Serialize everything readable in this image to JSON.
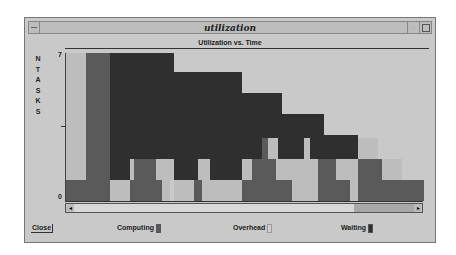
{
  "window": {
    "title": "utilization"
  },
  "chart": {
    "title": "Utilization vs. Time",
    "ylabel": [
      "N",
      "T",
      "A",
      "S",
      "K",
      "S"
    ],
    "ytick_top": "7",
    "ytick_bottom": "0"
  },
  "colors": {
    "computing": "#5a5a5a",
    "overhead": "#bdbdbd",
    "waiting": "#2f2f2f"
  },
  "legend": {
    "computing": "Computing",
    "overhead": "Overhead",
    "waiting": "Waiting"
  },
  "buttons": {
    "close": "Close"
  },
  "scroll": {
    "left": "◂",
    "right": "▸"
  },
  "chart_data": {
    "type": "area",
    "title": "Utilization vs. Time",
    "ylabel": "NTASKS",
    "xlabel": "",
    "ylim": [
      0,
      7
    ],
    "series": [
      {
        "name": "Computing",
        "color": "#5a5a5a"
      },
      {
        "name": "Overhead",
        "color": "#bdbdbd"
      },
      {
        "name": "Waiting",
        "color": "#2f2f2f"
      }
    ],
    "rects": [
      {
        "s": "overhead",
        "x0": 0,
        "x1": 20,
        "y0": 1,
        "y1": 7
      },
      {
        "s": "computing",
        "x0": 0,
        "x1": 44,
        "y0": 0,
        "y1": 1
      },
      {
        "s": "computing",
        "x0": 20,
        "x1": 44,
        "y0": 1,
        "y1": 7
      },
      {
        "s": "waiting",
        "x0": 44,
        "x1": 108,
        "y0": 1,
        "y1": 7
      },
      {
        "s": "waiting",
        "x0": 108,
        "x1": 176,
        "y0": 1,
        "y1": 6.1
      },
      {
        "s": "waiting",
        "x0": 176,
        "x1": 216,
        "y0": 2,
        "y1": 5.1
      },
      {
        "s": "waiting",
        "x0": 216,
        "x1": 258,
        "y0": 2,
        "y1": 4.1
      },
      {
        "s": "waiting",
        "x0": 258,
        "x1": 292,
        "y0": 2,
        "y1": 3.1
      },
      {
        "s": "overhead",
        "x0": 44,
        "x1": 64,
        "y0": 0,
        "y1": 1
      },
      {
        "s": "computing",
        "x0": 64,
        "x1": 96,
        "y0": 0,
        "y1": 1
      },
      {
        "s": "computing",
        "x0": 68,
        "x1": 90,
        "y0": 1,
        "y1": 2
      },
      {
        "s": "overhead",
        "x0": 64,
        "x1": 68,
        "y0": 1,
        "y1": 2
      },
      {
        "s": "overhead",
        "x0": 90,
        "x1": 108,
        "y0": 1,
        "y1": 2
      },
      {
        "s": "overhead",
        "x0": 96,
        "x1": 104,
        "y0": 0,
        "y1": 1
      },
      {
        "s": "overhead",
        "x0": 108,
        "x1": 128,
        "y0": 0,
        "y1": 1
      },
      {
        "s": "computing",
        "x0": 128,
        "x1": 136,
        "y0": 0,
        "y1": 1
      },
      {
        "s": "overhead",
        "x0": 132,
        "x1": 144,
        "y0": 1,
        "y1": 2
      },
      {
        "s": "overhead",
        "x0": 136,
        "x1": 176,
        "y0": 0,
        "y1": 1
      },
      {
        "s": "computing",
        "x0": 176,
        "x1": 226,
        "y0": 0,
        "y1": 1
      },
      {
        "s": "computing",
        "x0": 186,
        "x1": 210,
        "y0": 1,
        "y1": 2
      },
      {
        "s": "overhead",
        "x0": 176,
        "x1": 186,
        "y0": 1,
        "y1": 2
      },
      {
        "s": "computing",
        "x0": 196,
        "x1": 212,
        "y0": 2,
        "y1": 3
      },
      {
        "s": "overhead",
        "x0": 202,
        "x1": 212,
        "y0": 2,
        "y1": 3
      },
      {
        "s": "overhead",
        "x0": 210,
        "x1": 252,
        "y0": 1,
        "y1": 2
      },
      {
        "s": "overhead",
        "x0": 226,
        "x1": 252,
        "y0": 0,
        "y1": 1
      },
      {
        "s": "overhead",
        "x0": 238,
        "x1": 244,
        "y0": 2,
        "y1": 3
      },
      {
        "s": "computing",
        "x0": 252,
        "x1": 284,
        "y0": 0,
        "y1": 1
      },
      {
        "s": "computing",
        "x0": 252,
        "x1": 270,
        "y0": 1,
        "y1": 2
      },
      {
        "s": "overhead",
        "x0": 270,
        "x1": 292,
        "y0": 1,
        "y1": 2
      },
      {
        "s": "overhead",
        "x0": 284,
        "x1": 292,
        "y0": 0,
        "y1": 1
      },
      {
        "s": "computing",
        "x0": 292,
        "x1": 358,
        "y0": 0,
        "y1": 1
      },
      {
        "s": "computing",
        "x0": 292,
        "x1": 316,
        "y0": 1,
        "y1": 2
      },
      {
        "s": "overhead",
        "x0": 292,
        "x1": 312,
        "y0": 2,
        "y1": 3
      },
      {
        "s": "overhead",
        "x0": 316,
        "x1": 336,
        "y0": 1,
        "y1": 2
      }
    ]
  }
}
